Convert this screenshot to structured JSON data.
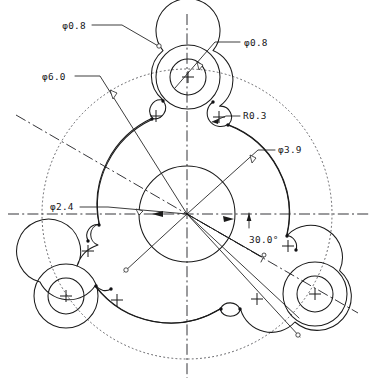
{
  "drawing": {
    "title": "Rotor plate with three lobed bosses",
    "units": "mm",
    "background_color": "#ffffff",
    "line_color": "#1a1a1a",
    "centerline_color": "#2a2a2e",
    "pitch_circle_color": "#55555a",
    "caption": ""
  },
  "geometry": {
    "center": {
      "x": 187,
      "y": 214
    },
    "hub_circle_radius": 48,
    "mid_arc_radius": 95,
    "pitch_circle_radius": 145,
    "lobe_outer_radius": 32,
    "lobe_inner_radius": 18,
    "fillet_radius": 11,
    "lobe_centers": [
      {
        "name": "top-lobe",
        "x": 188,
        "y": 77
      },
      {
        "name": "bottom-left-lobe",
        "x": 66,
        "y": 296
      },
      {
        "name": "bottom-right-lobe",
        "x": 315,
        "y": 294
      }
    ],
    "lobe_spacing_deg": 120,
    "angle_from_horizontal_deg": 30
  },
  "dimensions": [
    {
      "id": "dia-0-8-left",
      "label": "φ0.8",
      "kind": "diameter",
      "value": 0.8,
      "text_x": 86,
      "text_y": 29,
      "anchor": "end"
    },
    {
      "id": "dia-0-8-right",
      "label": "φ0.8",
      "kind": "diameter",
      "value": 0.8,
      "text_x": 244,
      "text_y": 46,
      "anchor": "start"
    },
    {
      "id": "dia-6-0",
      "label": "φ6.0",
      "kind": "diameter",
      "value": 6.0,
      "text_x": 42,
      "text_y": 80,
      "anchor": "start"
    },
    {
      "id": "rad-0-3",
      "label": "R0.3",
      "kind": "radius",
      "value": 0.3,
      "text_x": 243,
      "text_y": 119,
      "anchor": "start"
    },
    {
      "id": "dia-3-9",
      "label": "φ3.9",
      "kind": "diameter",
      "value": 3.9,
      "text_x": 278,
      "text_y": 153,
      "anchor": "start"
    },
    {
      "id": "dia-2-4",
      "label": "φ2.4",
      "kind": "diameter",
      "value": 2.4,
      "text_x": 50,
      "text_y": 210,
      "anchor": "start"
    },
    {
      "id": "angle-30",
      "label": "30.0°",
      "kind": "angle",
      "value": 30.0,
      "text_x": 249,
      "text_y": 243,
      "anchor": "start"
    }
  ],
  "center_marks": [
    {
      "id": "cm-top-lobe",
      "x": 188,
      "y": 77
    },
    {
      "id": "cm-bl-lobe",
      "x": 66,
      "y": 296
    },
    {
      "id": "cm-br-lobe",
      "x": 315,
      "y": 294
    },
    {
      "id": "cm-fillet-top-left",
      "x": 156,
      "y": 116
    },
    {
      "id": "cm-fillet-top-right",
      "x": 219,
      "y": 117
    },
    {
      "id": "cm-fillet-left-upper",
      "x": 88,
      "y": 251
    },
    {
      "id": "cm-fillet-left-lower",
      "x": 117,
      "y": 300
    },
    {
      "id": "cm-fillet-right-upper",
      "x": 288,
      "y": 246
    },
    {
      "id": "cm-fillet-right-lower",
      "x": 257,
      "y": 299
    }
  ]
}
